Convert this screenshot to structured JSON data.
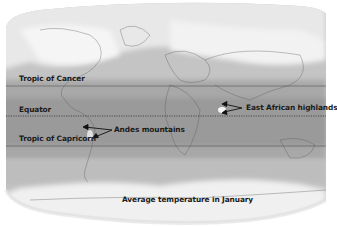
{
  "map": {
    "title": "Average temperature in January",
    "lines": [
      {
        "label": "Tropic of Cancer",
        "y": 86,
        "style": "solid"
      },
      {
        "label": "Equator",
        "y": 116,
        "style": "dotted"
      },
      {
        "label": "Tropic of Capricorn",
        "y": 146,
        "style": "solid"
      }
    ],
    "annotations": [
      {
        "label": "Andes mountains"
      },
      {
        "label": "East African highlands"
      }
    ],
    "colors": {
      "warm": "#9a9a9a",
      "mild": "#b8b8b8",
      "cool": "#d0d0d0",
      "cold": "#ececec",
      "line": "#444444"
    }
  }
}
